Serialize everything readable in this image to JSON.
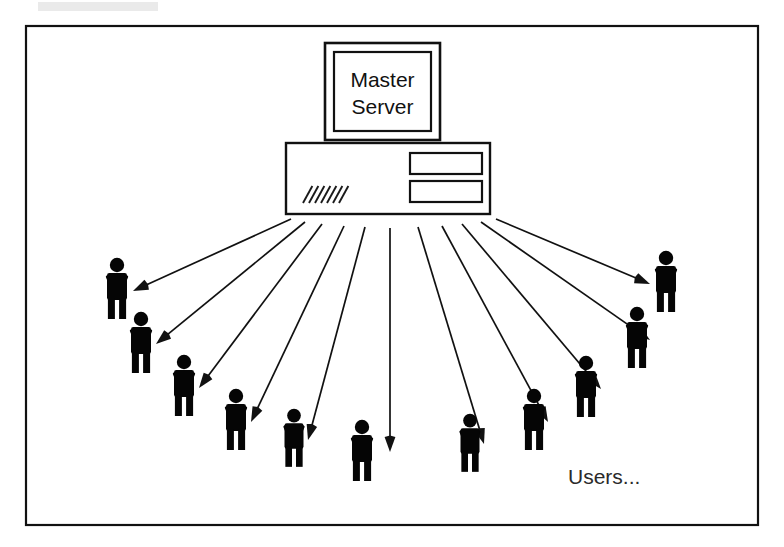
{
  "diagram": {
    "background_color": "#ffffff",
    "ink_color": "#111111",
    "frame": {
      "name": "outer-border",
      "x": 26,
      "y": 26,
      "width": 732,
      "height": 499
    },
    "server": {
      "monitor": {
        "outer": {
          "x": 325,
          "y": 43,
          "width": 115,
          "height": 97
        },
        "screen": {
          "x": 334,
          "y": 52,
          "width": 97,
          "height": 79
        },
        "label_line1": "Master",
        "label_line2": "Server"
      },
      "tower": {
        "x": 286,
        "y": 143,
        "width": 204,
        "height": 71,
        "drive_bays": [
          {
            "x": 410,
            "y": 153,
            "width": 72,
            "height": 21
          },
          {
            "x": 410,
            "y": 181,
            "width": 72,
            "height": 21
          }
        ],
        "vent": {
          "x": 303,
          "y": 186,
          "count": 7,
          "spacing": 6,
          "length": 17
        }
      }
    },
    "users_label": {
      "text": "Users...",
      "x": 568,
      "y": 484
    },
    "person_count": 11,
    "people": [
      {
        "id": "user-1",
        "x": 117,
        "y": 296,
        "scale": 1.0
      },
      {
        "id": "user-2",
        "x": 141,
        "y": 350,
        "scale": 1.0
      },
      {
        "id": "user-3",
        "x": 184,
        "y": 393,
        "scale": 1.0
      },
      {
        "id": "user-4",
        "x": 236,
        "y": 427,
        "scale": 1.0
      },
      {
        "id": "user-5",
        "x": 294,
        "y": 445,
        "scale": 0.95
      },
      {
        "id": "user-6",
        "x": 362,
        "y": 458,
        "scale": 1.0
      },
      {
        "id": "user-7",
        "x": 470,
        "y": 450,
        "scale": 0.95
      },
      {
        "id": "user-8",
        "x": 534,
        "y": 427,
        "scale": 1.0
      },
      {
        "id": "user-9",
        "x": 586,
        "y": 394,
        "scale": 1.0
      },
      {
        "id": "user-10",
        "x": 637,
        "y": 345,
        "scale": 1.0
      },
      {
        "id": "user-11",
        "x": 666,
        "y": 289,
        "scale": 1.0
      }
    ],
    "arrows": [
      {
        "id": "arrow-1",
        "x1": 291,
        "y1": 219,
        "x2": 133,
        "y2": 291
      },
      {
        "id": "arrow-2",
        "x1": 305,
        "y1": 222,
        "x2": 156,
        "y2": 344
      },
      {
        "id": "arrow-3",
        "x1": 322,
        "y1": 224,
        "x2": 199,
        "y2": 388
      },
      {
        "id": "arrow-4",
        "x1": 344,
        "y1": 226,
        "x2": 251,
        "y2": 422
      },
      {
        "id": "arrow-5",
        "x1": 365,
        "y1": 227,
        "x2": 308,
        "y2": 440
      },
      {
        "id": "arrow-6",
        "x1": 390,
        "y1": 228,
        "x2": 390,
        "y2": 452
      },
      {
        "id": "arrow-7",
        "x1": 418,
        "y1": 227,
        "x2": 484,
        "y2": 444
      },
      {
        "id": "arrow-8",
        "x1": 442,
        "y1": 226,
        "x2": 548,
        "y2": 422
      },
      {
        "id": "arrow-9",
        "x1": 462,
        "y1": 224,
        "x2": 601,
        "y2": 389
      },
      {
        "id": "arrow-10",
        "x1": 481,
        "y1": 222,
        "x2": 650,
        "y2": 340
      },
      {
        "id": "arrow-11",
        "x1": 496,
        "y1": 219,
        "x2": 650,
        "y2": 284
      }
    ],
    "person_geometry": {
      "head_radius": 7.2,
      "head_cy": -31,
      "body_width": 20,
      "body_height": 27,
      "body_top": -23,
      "arm_width": 5.6,
      "arm_length": 23,
      "arm_angle_deg": 22,
      "leg_width": 7.0,
      "leg_height": 21,
      "leg_gap": 4.2
    }
  }
}
